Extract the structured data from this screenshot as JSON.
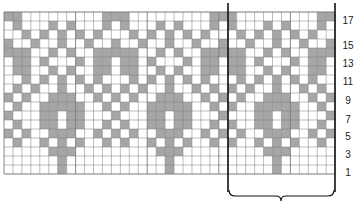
{
  "chart_data": {
    "type": "table",
    "title": "",
    "columns": 37,
    "rows": 18,
    "colors": {
      "contrast": "#a6a6a6",
      "background": "#ffffff",
      "gridline": "#7a7a7a",
      "repeat_line": "#111111"
    },
    "repeat": {
      "start_col": 25,
      "end_col": 36,
      "width": 12
    },
    "row_labels": [
      "1",
      "3",
      "5",
      "7",
      "9",
      "11",
      "13",
      "15",
      "17"
    ],
    "grid_top_to_bottom": [
      "GG.........GGG.........GGG.........GG",
      ".G...G.G...G.G...G.G...G.G...G.G...G.",
      "..G.G.G.G.G...G.G.G.G.G...G.G.G.G.G..",
      "G..G..G..G..G..G..G..G..G..G..G..G..G",
      "GGG..G.G..GGGGG..G.G..GGGGG..G.G..GGG",
      ".GG.G...G.GG.GG.G...G.GG.GG.G...G.GG.",
      ".GG..G.G..GG.GG..G.G..GG.GG..G.G..GG.",
      "..G.G.G.G.G...G.G.G.G.G...G.G.G.G.G..",
      ".G.G..G..G.G.G.G..G..G.G.G.G..G..G.G.",
      "G.G..GGG..G.G.G..GGG..G.G.G..GGG..G.G",
      ".G..GGGGG..G.G..GGGGG..G.G..GGGGG..G.",
      "G...GG.GG...G...GG.GG...G...GG.GG...G",
      ".G..GG.GG..G.G..GG.GG..G.G..GG.GG..G.",
      "G.G..GGG..G.G.G..GGG..G.G.G..GGG..G.G",
      ".G..G.G.G..G.G..G.G.G..G.G..G.G.G..G.",
      ".....GGG.........GGG.........GGG.....",
      "......G...........G...........G......",
      "......G...........G...........G......"
    ]
  },
  "labels": {
    "row_1": "1",
    "row_3": "3",
    "row_5": "5",
    "row_7": "7",
    "row_9": "9",
    "row_11": "11",
    "row_13": "13",
    "row_15": "15",
    "row_17": "17"
  }
}
